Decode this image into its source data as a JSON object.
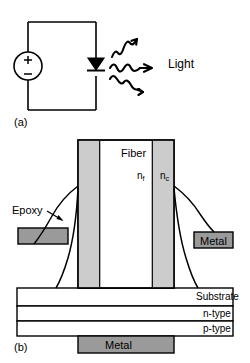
{
  "figure": {
    "panel_a": {
      "caption": "(a)",
      "light_label": "Light",
      "source_plus": "+",
      "source_minus": "−",
      "components": [
        "voltage-source",
        "led-diode",
        "light-rays"
      ]
    },
    "panel_b": {
      "caption": "(b)",
      "fiber_label": "Fiber",
      "index_fiber": "n",
      "index_fiber_sub": "f",
      "index_clad": "n",
      "index_clad_sub": "c",
      "epoxy_label": "Epoxy",
      "metal_right_label": "Metal",
      "metal_bottom_label": "Metal",
      "substrate_label": "Substrate",
      "ntype_label": "n-type",
      "ptype_label": "p-type"
    }
  },
  "colors": {
    "line": "#000000",
    "cladding_fill": "#cccccc",
    "metal_fill": "#9a9a9a",
    "core_fill": "#ffffff",
    "background": "#ffffff"
  }
}
